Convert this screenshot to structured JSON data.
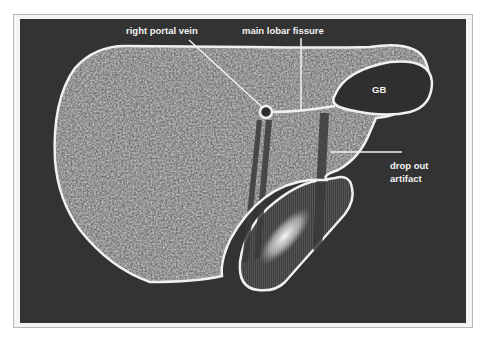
{
  "figure": {
    "labels": {
      "right_portal_vein": "right portal vein",
      "main_lobar_fissure": "main lobar fissure",
      "gallbladder": "GB",
      "drop_out_artifact_line1": "drop out",
      "drop_out_artifact_line2": "artifact"
    },
    "colors": {
      "background": "#333333",
      "outline": "#f0f0f0",
      "parenchyma": "#8a8a8a",
      "gallbladder": "#2f2f2f",
      "shadow": "#4a4a4a"
    }
  }
}
